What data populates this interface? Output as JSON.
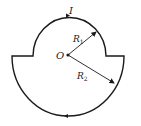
{
  "diagram": {
    "current_label": "I",
    "center_label": "O",
    "radius_small_label": "R",
    "radius_small_sub": "1",
    "radius_large_label": "R",
    "radius_large_sub": "2",
    "colors": {
      "line": "#1a1a1a",
      "background": "#ffffff"
    }
  }
}
